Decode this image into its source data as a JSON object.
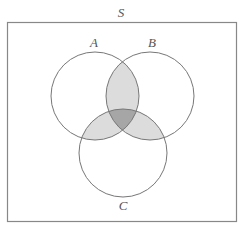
{
  "diagram": {
    "type": "venn",
    "universe_label": "S",
    "sets": [
      {
        "id": "A",
        "label": "A",
        "cx": 95,
        "cy": 96,
        "r": 44
      },
      {
        "id": "B",
        "label": "B",
        "cx": 150,
        "cy": 96,
        "r": 44
      },
      {
        "id": "C",
        "label": "C",
        "cx": 123,
        "cy": 153,
        "r": 44
      }
    ],
    "shaded_regions": [
      "A∩B",
      "A∩C",
      "B∩C"
    ],
    "darker_region": "A∩B∩C",
    "colors": {
      "stroke": "#777777",
      "pair_fill": "#dcdcdc",
      "triple_fill": "#a6a6a6",
      "background": "#ffffff"
    }
  }
}
